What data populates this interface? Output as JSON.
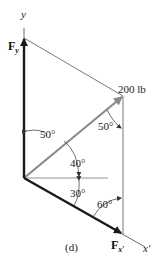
{
  "diagram": {
    "caption": "(d)",
    "axes": {
      "y_label": "y",
      "x_prime_label": "x",
      "x_prime_mark": "′"
    },
    "force": {
      "magnitude_label": "200 lb",
      "color": "#8a8a8a"
    },
    "components": {
      "fy_main": "F",
      "fy_sub": "y",
      "fx_main": "F",
      "fx_sub": "x′",
      "color": "#1a1a1a"
    },
    "angles": {
      "top_left": "50°",
      "top_right": "50°",
      "middle": "40°",
      "lower": "30°",
      "bottom_right": "60°"
    }
  }
}
